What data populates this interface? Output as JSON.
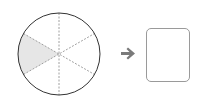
{
  "diagram": {
    "circle": {
      "center": [
        59,
        54
      ],
      "radius": 41,
      "sectors": 6,
      "shaded_sectors": 1,
      "shaded_sector_position": "left",
      "stroke_color": "#333333",
      "divider_color": "#888888",
      "shade_color": "#e6e6e6"
    },
    "arrow": {
      "icon": "arrow-right-icon",
      "color": "#7a7a7a"
    },
    "answer_box": {
      "value": "",
      "border_color": "#9a9a9a"
    }
  }
}
